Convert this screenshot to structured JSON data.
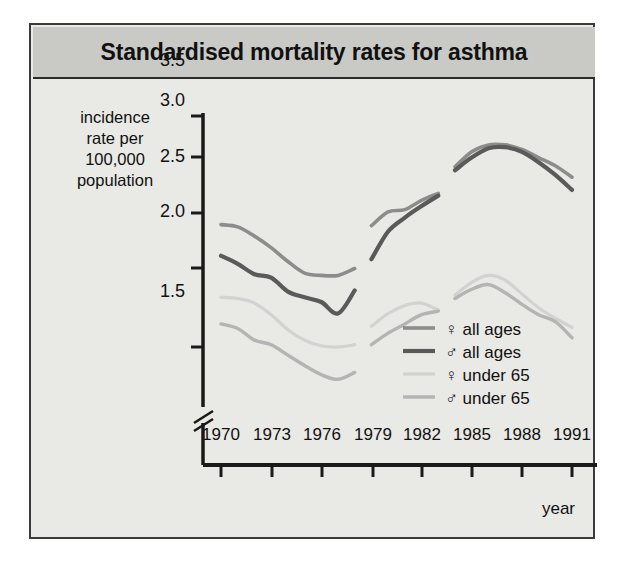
{
  "figure": {
    "title": "Standardised mortality rates for asthma",
    "background_color": "#e9e9e6",
    "title_bar_color": "#c9c9c6",
    "plot_background_color": "#ffffff",
    "border_color": "#3a3a3a"
  },
  "chart_data": {
    "type": "line",
    "title": "Standardised mortality rates for asthma",
    "xlabel": "year",
    "ylabel": "incidence rate per 100,000 population",
    "xlim": [
      1970,
      1991
    ],
    "ylim": [
      1.15,
      3.5
    ],
    "grid": false,
    "y_axis_break": true,
    "y_axis_break_symbol": "//",
    "legend_position": "inside-bottom-right",
    "xticks": [
      "1970",
      "1973",
      "1976",
      "1979",
      "1982",
      "1985",
      "1988",
      "1991"
    ],
    "xtick_values": [
      1970,
      1973,
      1976,
      1979,
      1982,
      1985,
      1988,
      1991
    ],
    "yticks": [
      "1.5",
      "2.0",
      "2.5",
      "3.0",
      "3.5"
    ],
    "ytick_values": [
      1.5,
      2.0,
      2.5,
      3.0,
      3.5
    ],
    "series_breaks": [
      [
        1978,
        1979
      ],
      [
        1983,
        1984
      ]
    ],
    "series": [
      {
        "name": "♀ all ages",
        "legend_symbol": "♀",
        "legend_text": "all ages",
        "color": "#8c8c8c",
        "x": [
          1970,
          1971,
          1972,
          1973,
          1974,
          1975,
          1976,
          1977,
          1978,
          1979,
          1980,
          1981,
          1982,
          1983,
          1984,
          1985,
          1986,
          1987,
          1988,
          1989,
          1990,
          1991
        ],
        "values": [
          2.56,
          2.54,
          2.46,
          2.36,
          2.24,
          2.14,
          2.12,
          2.12,
          2.18,
          2.55,
          2.67,
          2.69,
          2.77,
          2.83,
          3.06,
          3.19,
          3.25,
          3.25,
          3.21,
          3.14,
          3.07,
          2.97
        ]
      },
      {
        "name": "♂ all ages",
        "legend_symbol": "♂",
        "legend_text": "all ages",
        "color": "#5a5a5a",
        "x": [
          1970,
          1971,
          1972,
          1973,
          1974,
          1975,
          1976,
          1977,
          1978,
          1979,
          1980,
          1981,
          1982,
          1983,
          1984,
          1985,
          1986,
          1987,
          1988,
          1989,
          1990,
          1991
        ],
        "values": [
          2.29,
          2.22,
          2.13,
          2.1,
          1.98,
          1.93,
          1.89,
          1.79,
          1.99,
          2.26,
          2.5,
          2.62,
          2.72,
          2.81,
          3.03,
          3.14,
          3.22,
          3.23,
          3.19,
          3.1,
          2.99,
          2.86
        ]
      },
      {
        "name": "♀ under 65",
        "legend_symbol": "♀",
        "legend_text": "under 65",
        "color": "#d2d2d2",
        "x": [
          1970,
          1971,
          1972,
          1973,
          1974,
          1975,
          1976,
          1977,
          1978,
          1979,
          1980,
          1981,
          1982,
          1983,
          1984,
          1985,
          1986,
          1987,
          1988,
          1989,
          1990,
          1991
        ],
        "values": [
          1.93,
          1.92,
          1.88,
          1.78,
          1.65,
          1.56,
          1.51,
          1.5,
          1.52,
          1.68,
          1.79,
          1.86,
          1.88,
          1.82,
          1.95,
          2.06,
          2.12,
          2.08,
          1.96,
          1.84,
          1.75,
          1.67
        ]
      },
      {
        "name": "♂ under 65",
        "legend_symbol": "♂",
        "legend_text": "under 65",
        "color": "#b4b4b4",
        "x": [
          1970,
          1971,
          1972,
          1973,
          1974,
          1975,
          1976,
          1977,
          1978,
          1979,
          1980,
          1981,
          1982,
          1983,
          1984,
          1985,
          1986,
          1987,
          1988,
          1989,
          1990,
          1991
        ],
        "values": [
          1.7,
          1.66,
          1.56,
          1.52,
          1.43,
          1.34,
          1.26,
          1.22,
          1.28,
          1.52,
          1.62,
          1.7,
          1.78,
          1.81,
          1.92,
          2.0,
          2.04,
          1.97,
          1.87,
          1.78,
          1.72,
          1.58
        ]
      }
    ]
  },
  "legend": {
    "entries": [
      {
        "symbol": "♀",
        "label": "all ages",
        "color": "#8c8c8c"
      },
      {
        "symbol": "♂",
        "label": "all ages",
        "color": "#5a5a5a"
      },
      {
        "symbol": "♀",
        "label": "under 65",
        "color": "#d2d2d2"
      },
      {
        "symbol": "♂",
        "label": "under 65",
        "color": "#b4b4b4"
      }
    ]
  },
  "axes": {
    "ylabel_line1": "incidence",
    "ylabel_line2": "rate per",
    "ylabel_line3": "100,000",
    "ylabel_line4": "population",
    "xlabel": "year"
  }
}
